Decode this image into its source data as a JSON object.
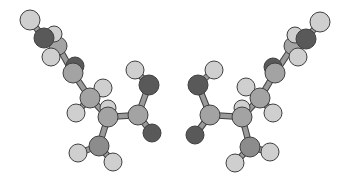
{
  "figure": {
    "colors": {
      "background": "#ffffff",
      "hydrogen": "#cfcfcf",
      "carbon": "#a3a3a3",
      "nitrogen": "#8c8c8c",
      "oxygen": "#595959",
      "bond": "#9a9a9a",
      "outline": "#3f3f3f"
    },
    "molecules": [
      {
        "name": "left-enantiomer",
        "atoms": [
          {
            "id": "a1",
            "el": "C",
            "x": 58,
            "y": 46,
            "r": 9
          },
          {
            "id": "a2",
            "el": "H",
            "x": 54,
            "y": 34,
            "r": 8
          },
          {
            "id": "a3",
            "el": "O",
            "x": 44,
            "y": 38,
            "r": 10
          },
          {
            "id": "a4",
            "el": "H",
            "x": 30,
            "y": 20,
            "r": 10
          },
          {
            "id": "a5",
            "el": "H",
            "x": 51,
            "y": 57,
            "r": 9
          },
          {
            "id": "a6",
            "el": "O",
            "x": 75,
            "y": 66,
            "r": 9
          },
          {
            "id": "a7",
            "el": "C",
            "x": 73,
            "y": 73,
            "r": 10
          },
          {
            "id": "a8",
            "el": "H",
            "x": 103,
            "y": 88,
            "r": 9
          },
          {
            "id": "a9",
            "el": "H",
            "x": 108,
            "y": 108,
            "r": 8
          },
          {
            "id": "a10",
            "el": "C",
            "x": 90,
            "y": 98,
            "r": 10
          },
          {
            "id": "a11",
            "el": "H",
            "x": 76,
            "y": 113,
            "r": 9
          },
          {
            "id": "a12",
            "el": "C",
            "x": 108,
            "y": 117,
            "r": 10
          },
          {
            "id": "a13",
            "el": "H",
            "x": 135,
            "y": 70,
            "r": 9
          },
          {
            "id": "a14",
            "el": "O",
            "x": 149,
            "y": 85,
            "r": 10
          },
          {
            "id": "a15",
            "el": "C",
            "x": 138,
            "y": 115,
            "r": 10
          },
          {
            "id": "a16",
            "el": "O",
            "x": 152,
            "y": 133,
            "r": 9
          },
          {
            "id": "a17",
            "el": "N",
            "x": 99,
            "y": 146,
            "r": 10
          },
          {
            "id": "a18",
            "el": "H",
            "x": 78,
            "y": 153,
            "r": 9
          },
          {
            "id": "a19",
            "el": "H",
            "x": 113,
            "y": 162,
            "r": 9
          }
        ],
        "bonds": [
          [
            "a4",
            "a3"
          ],
          [
            "a3",
            "a1"
          ],
          [
            "a2",
            "a1"
          ],
          [
            "a1",
            "a5"
          ],
          [
            "a1",
            "a7"
          ],
          [
            "a6",
            "a7"
          ],
          [
            "a7",
            "a10"
          ],
          [
            "a10",
            "a8"
          ],
          [
            "a10",
            "a11"
          ],
          [
            "a10",
            "a12"
          ],
          [
            "a12",
            "a9"
          ],
          [
            "a12",
            "a15"
          ],
          [
            "a15",
            "a14"
          ],
          [
            "a14",
            "a13"
          ],
          [
            "a15",
            "a16"
          ],
          [
            "a12",
            "a17"
          ],
          [
            "a17",
            "a18"
          ],
          [
            "a17",
            "a19"
          ]
        ]
      },
      {
        "name": "right-enantiomer",
        "atoms": [
          {
            "id": "b1",
            "el": "C",
            "x": 293,
            "y": 46,
            "r": 9
          },
          {
            "id": "b2",
            "el": "H",
            "x": 295,
            "y": 35,
            "r": 8
          },
          {
            "id": "b3",
            "el": "O",
            "x": 306,
            "y": 39,
            "r": 10
          },
          {
            "id": "b4",
            "el": "H",
            "x": 320,
            "y": 22,
            "r": 10
          },
          {
            "id": "b5",
            "el": "H",
            "x": 298,
            "y": 57,
            "r": 9
          },
          {
            "id": "b6",
            "el": "O",
            "x": 273,
            "y": 67,
            "r": 9
          },
          {
            "id": "b7",
            "el": "C",
            "x": 275,
            "y": 73,
            "r": 10
          },
          {
            "id": "b8",
            "el": "H",
            "x": 246,
            "y": 87,
            "r": 9
          },
          {
            "id": "b9",
            "el": "H",
            "x": 242,
            "y": 108,
            "r": 8
          },
          {
            "id": "b10",
            "el": "C",
            "x": 260,
            "y": 98,
            "r": 10
          },
          {
            "id": "b11",
            "el": "H",
            "x": 273,
            "y": 113,
            "r": 9
          },
          {
            "id": "b12",
            "el": "C",
            "x": 242,
            "y": 117,
            "r": 10
          },
          {
            "id": "b13",
            "el": "H",
            "x": 214,
            "y": 70,
            "r": 9
          },
          {
            "id": "b14",
            "el": "O",
            "x": 198,
            "y": 85,
            "r": 10
          },
          {
            "id": "b15",
            "el": "C",
            "x": 210,
            "y": 115,
            "r": 10
          },
          {
            "id": "b16",
            "el": "O",
            "x": 195,
            "y": 135,
            "r": 9
          },
          {
            "id": "b17",
            "el": "N",
            "x": 250,
            "y": 147,
            "r": 10
          },
          {
            "id": "b18",
            "el": "H",
            "x": 270,
            "y": 152,
            "r": 9
          },
          {
            "id": "b19",
            "el": "H",
            "x": 235,
            "y": 163,
            "r": 9
          }
        ],
        "bonds": [
          [
            "b4",
            "b3"
          ],
          [
            "b3",
            "b1"
          ],
          [
            "b2",
            "b1"
          ],
          [
            "b1",
            "b5"
          ],
          [
            "b1",
            "b7"
          ],
          [
            "b6",
            "b7"
          ],
          [
            "b7",
            "b10"
          ],
          [
            "b10",
            "b8"
          ],
          [
            "b10",
            "b11"
          ],
          [
            "b10",
            "b12"
          ],
          [
            "b12",
            "b9"
          ],
          [
            "b12",
            "b15"
          ],
          [
            "b15",
            "b14"
          ],
          [
            "b14",
            "b13"
          ],
          [
            "b15",
            "b16"
          ],
          [
            "b12",
            "b17"
          ],
          [
            "b17",
            "b18"
          ],
          [
            "b17",
            "b19"
          ]
        ]
      }
    ]
  }
}
